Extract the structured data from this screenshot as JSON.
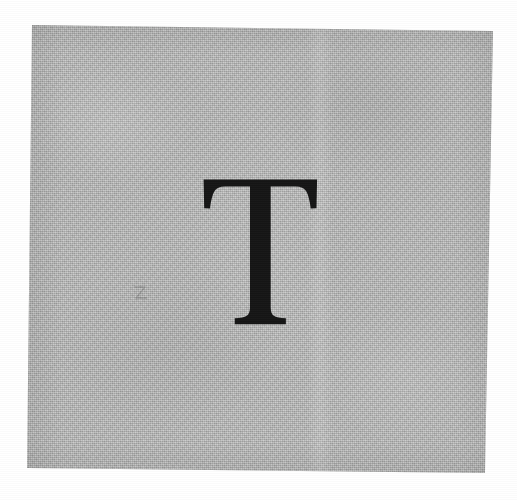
{
  "image": {
    "kind": "scanned-specimen",
    "subject": "printed serif capital letter on gray card stock",
    "canvas_width": 517,
    "canvas_height": 500,
    "background_color": "#ffffff"
  },
  "paper": {
    "name": "gray card stock",
    "fill_color": "#b3b4b3",
    "texture": "fine woven crosshatch halftone",
    "corners": {
      "top_left": "32,25",
      "top_right": "493,31",
      "bottom_right": "485,473",
      "bottom_left": "27,468"
    },
    "artifacts": {
      "fold_band_label": "vertical light band",
      "vignette_label": "edge shading"
    }
  },
  "glyph": {
    "character": "T",
    "name": "capital-letter-t",
    "style": "serif",
    "ink_color": "#151515",
    "bounds": {
      "left": 203,
      "top": 180,
      "right": 318,
      "bottom": 325,
      "width": 115,
      "height": 145
    }
  },
  "annotation": {
    "pencil_mark_label": "faint pencil mark",
    "pencil_mark_position": "140,293"
  }
}
